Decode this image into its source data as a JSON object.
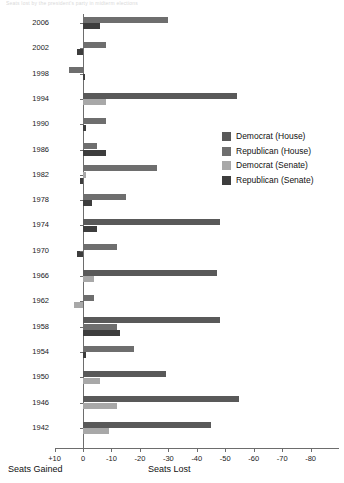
{
  "top_caption": "Seats lost by the president's party in midterm elections",
  "axis": {
    "y_title": "Year",
    "x_left_caption": "Seats Gained",
    "x_right_caption": "Seats Lost",
    "x_ticks": [
      "+10",
      "0",
      "-10",
      "-20",
      "-30",
      "-40",
      "-50",
      "-60",
      "-70",
      "-80"
    ],
    "x_tick_values": [
      10,
      0,
      -10,
      -20,
      -30,
      -40,
      -50,
      -60,
      -70,
      -80
    ]
  },
  "legend": {
    "items": [
      {
        "label": "Democrat (House)",
        "color": "#595959"
      },
      {
        "label": "Republican (House)",
        "color": "#6e6e6e"
      },
      {
        "label": "Democrat (Senate)",
        "color": "#a8a8a8"
      },
      {
        "label": "Republican (Senate)",
        "color": "#3d3d3d"
      }
    ]
  },
  "chart_data": {
    "type": "bar",
    "orientation": "horizontal",
    "title": "Seats lost by the president's party in midterm elections",
    "xlabel": "Seats Lost",
    "ylabel": "Year",
    "xlim": [
      10,
      -80
    ],
    "grid": false,
    "legend_position": "right",
    "categories": [
      2006,
      2002,
      1998,
      1994,
      1990,
      1986,
      1982,
      1978,
      1974,
      1970,
      1966,
      1962,
      1958,
      1954,
      1950,
      1946,
      1942
    ],
    "series": [
      {
        "name": "Democrat (House)",
        "color": "#595959",
        "values": [
          null,
          null,
          null,
          -54,
          null,
          null,
          null,
          null,
          -48,
          null,
          -47,
          null,
          -48,
          null,
          -29,
          -55,
          -45
        ]
      },
      {
        "name": "Republican (House)",
        "color": "#6e6e6e",
        "values": [
          -30,
          -8,
          5,
          null,
          -8,
          -5,
          -26,
          -15,
          null,
          -12,
          null,
          -4,
          -12,
          -18,
          null,
          null,
          null
        ]
      },
      {
        "name": "Democrat (Senate)",
        "color": "#a8a8a8",
        "values": [
          null,
          null,
          null,
          -8,
          null,
          null,
          -1,
          null,
          null,
          null,
          -4,
          3,
          null,
          null,
          -6,
          -12,
          -9
        ]
      },
      {
        "name": "Republican (Senate)",
        "color": "#3d3d3d",
        "values": [
          -6,
          2,
          0,
          null,
          -1,
          -8,
          1,
          -3,
          -5,
          2,
          null,
          null,
          -13,
          -1,
          null,
          null,
          null
        ]
      }
    ]
  }
}
